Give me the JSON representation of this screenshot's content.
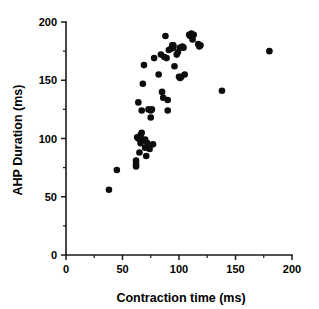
{
  "chart_data": {
    "type": "scatter",
    "title": "",
    "subtitle": "",
    "xlabel": "Contraction time (ms)",
    "ylabel": "AHP Duration (ms)",
    "xlim": [
      0,
      200
    ],
    "ylim": [
      0,
      200
    ],
    "x_ticks": [
      0,
      50,
      100,
      150,
      200
    ],
    "y_ticks": [
      0,
      50,
      100,
      150,
      200
    ],
    "x_tick_labels": [
      "0",
      "50",
      "100",
      "150",
      "200"
    ],
    "y_tick_labels": [
      "0",
      "50",
      "100",
      "150",
      "200"
    ],
    "x_minor_ticks": [
      25,
      75,
      125,
      175
    ],
    "y_minor_ticks": [
      25,
      75,
      125,
      175
    ],
    "grid": false,
    "legend": null,
    "legend_position": "none",
    "marker": {
      "shape": "circle",
      "color": "#0d0d0d",
      "size_px": 3.3
    },
    "axis_color": "#1a1a1a",
    "background_color": "#ffffff",
    "n_points": 62,
    "series": [
      {
        "name": "Motor units",
        "points": [
          [
            38,
            56
          ],
          [
            45,
            73
          ],
          [
            62,
            78
          ],
          [
            62,
            81
          ],
          [
            62,
            76
          ],
          [
            63,
            101
          ],
          [
            64,
            100
          ],
          [
            64,
            131
          ],
          [
            65,
            88
          ],
          [
            66,
            103
          ],
          [
            66,
            96
          ],
          [
            67,
            105
          ],
          [
            67,
            99
          ],
          [
            67,
            124
          ],
          [
            68,
            147
          ],
          [
            69,
            163
          ],
          [
            70,
            92
          ],
          [
            70,
            99
          ],
          [
            71,
            85
          ],
          [
            72,
            96
          ],
          [
            73,
            125
          ],
          [
            74,
            91
          ],
          [
            75,
            124
          ],
          [
            75,
            118
          ],
          [
            76,
            125
          ],
          [
            77,
            95
          ],
          [
            78,
            169
          ],
          [
            82,
            155
          ],
          [
            84,
            172
          ],
          [
            85,
            140
          ],
          [
            86,
            135
          ],
          [
            87,
            170
          ],
          [
            88,
            188
          ],
          [
            89,
            169
          ],
          [
            90,
            133
          ],
          [
            90,
            124
          ],
          [
            91,
            176
          ],
          [
            93,
            177
          ],
          [
            94,
            180
          ],
          [
            95,
            180
          ],
          [
            95,
            178
          ],
          [
            96,
            162
          ],
          [
            98,
            172
          ],
          [
            99,
            174
          ],
          [
            100,
            153
          ],
          [
            101,
            178
          ],
          [
            101,
            152
          ],
          [
            102,
            153
          ],
          [
            103,
            179
          ],
          [
            104,
            178
          ],
          [
            105,
            155
          ],
          [
            109,
            189
          ],
          [
            110,
            188
          ],
          [
            111,
            190
          ],
          [
            112,
            185
          ],
          [
            113,
            189
          ],
          [
            117,
            181
          ],
          [
            118,
            179
          ],
          [
            119,
            180
          ],
          [
            138,
            141
          ],
          [
            180,
            175
          ]
        ]
      }
    ]
  },
  "figure": {
    "caption": ""
  }
}
